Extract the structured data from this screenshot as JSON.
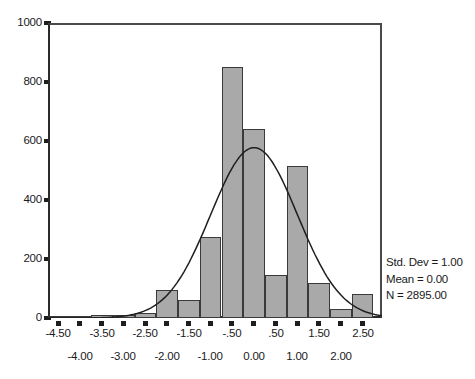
{
  "chart_data": {
    "type": "bar",
    "title": "",
    "subtitle": "",
    "xlabel": "",
    "ylabel": "",
    "ylim": [
      0,
      1000
    ],
    "xlim": [
      -4.75,
      2.95
    ],
    "grid": false,
    "bin_width": 0.5,
    "legend_position": "right",
    "bar_color": "#a9a9a9",
    "bar_edge_color": "#3a3a3a",
    "curve_color": "#1e1e1e",
    "y_ticks": [
      0,
      200,
      400,
      600,
      800,
      1000
    ],
    "y_tick_labels": [
      "0",
      "200",
      "400",
      "600",
      "800",
      "1000"
    ],
    "x_ticks_upper": [
      -4.5,
      -3.5,
      -2.5,
      -1.5,
      -0.5,
      0.5,
      1.5,
      2.5
    ],
    "x_tick_labels_upper": [
      "-4.50",
      "-3.50",
      "-2.50",
      "-1.50",
      "-.50",
      ".50",
      "1.50",
      "2.50"
    ],
    "x_ticks_lower": [
      -4.0,
      -3.0,
      -2.0,
      -1.0,
      0.0,
      1.0,
      2.0
    ],
    "x_tick_labels_lower": [
      "-4.00",
      "-3.00",
      "-2.00",
      "-1.00",
      "0.00",
      "1.00",
      "2.00"
    ],
    "bin_centers": [
      -4.5,
      -4.0,
      -3.5,
      -3.0,
      -2.5,
      -2.0,
      -1.5,
      -1.0,
      -0.5,
      0.0,
      0.5,
      1.0,
      1.5,
      2.0,
      2.5
    ],
    "categories": [
      "-4.50",
      "-4.00",
      "-3.50",
      "-3.00",
      "-2.50",
      "-2.00",
      "-1.50",
      "-1.00",
      "-.50",
      "0.00",
      ".50",
      "1.00",
      "1.50",
      "2.00",
      "2.50"
    ],
    "values": [
      3,
      2,
      10,
      12,
      18,
      95,
      60,
      275,
      850,
      640,
      145,
      515,
      120,
      30,
      80
    ],
    "overlay_curve": {
      "name": "normal-distribution-curve",
      "mean": 0.0,
      "std_dev": 1.0,
      "n": 2895,
      "peak_value": 575
    }
  },
  "stats": {
    "std_dev": "Std. Dev = 1.00",
    "mean": "Mean = 0.00",
    "n": "N = 2895.00"
  }
}
